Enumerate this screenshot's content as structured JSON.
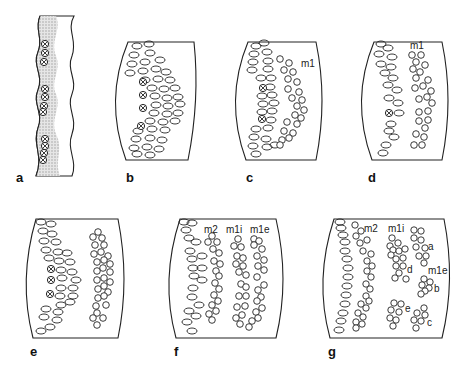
{
  "figure": {
    "stroke_color": "#222222",
    "stipple_color": "#c8c8c8",
    "panels": [
      {
        "id": "a",
        "label": "a",
        "zone_labels": []
      },
      {
        "id": "b",
        "label": "b",
        "zone_labels": []
      },
      {
        "id": "c",
        "label": "c",
        "zone_labels": [
          "m1"
        ]
      },
      {
        "id": "d",
        "label": "d",
        "zone_labels": [
          "m1"
        ]
      },
      {
        "id": "e",
        "label": "e",
        "zone_labels": []
      },
      {
        "id": "f",
        "label": "f",
        "zone_labels": [
          "m2",
          "m1i",
          "m1e"
        ]
      },
      {
        "id": "g",
        "label": "g",
        "zone_labels": [
          "m2",
          "m1i",
          "m1e",
          "a",
          "b",
          "c",
          "d",
          "e"
        ]
      }
    ]
  }
}
